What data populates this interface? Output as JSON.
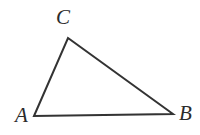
{
  "figure": {
    "kind": "geometry-diagram",
    "shape": "triangle",
    "background_color": "#ffffff",
    "stroke_color": "#333333",
    "stroke_width": 2,
    "label_color": "#2b2b2b",
    "canvas": {
      "width": 200,
      "height": 135
    },
    "vertices": [
      {
        "id": "A",
        "label": "A",
        "x": 34,
        "y": 116,
        "label_x": 15,
        "label_y": 105
      },
      {
        "id": "B",
        "label": "B",
        "x": 173,
        "y": 114,
        "label_x": 179,
        "label_y": 103
      },
      {
        "id": "C",
        "label": "C",
        "x": 68,
        "y": 38,
        "label_x": 56,
        "label_y": 7
      }
    ],
    "edges": [
      {
        "id": "AC",
        "from": "A",
        "to": "C"
      },
      {
        "id": "CB",
        "from": "C",
        "to": "B"
      },
      {
        "id": "AB",
        "from": "A",
        "to": "B"
      }
    ]
  }
}
